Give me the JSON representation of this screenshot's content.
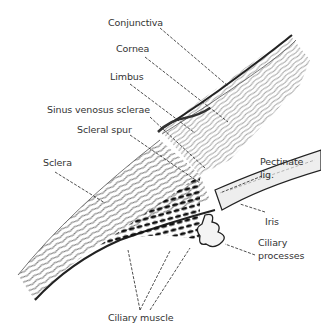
{
  "diagram": {
    "labels": {
      "conjunctiva": "Conjunctiva",
      "cornea": "Cornea",
      "limbus": "Limbus",
      "sinus": "Sinus venosus sclerae",
      "spur": "Scleral spur",
      "sclera": "Sclera",
      "pectinate_1": "Pectinate",
      "pectinate_2": "lig.",
      "iris": "Iris",
      "ciliary_proc_1": "Ciliary",
      "ciliary_proc_2": "processes",
      "ciliary_muscle": "Ciliary muscle"
    },
    "colors": {
      "ink": "#222222",
      "label": "#333333",
      "tissue_light": "#e6e6e6",
      "background": "#ffffff"
    }
  }
}
